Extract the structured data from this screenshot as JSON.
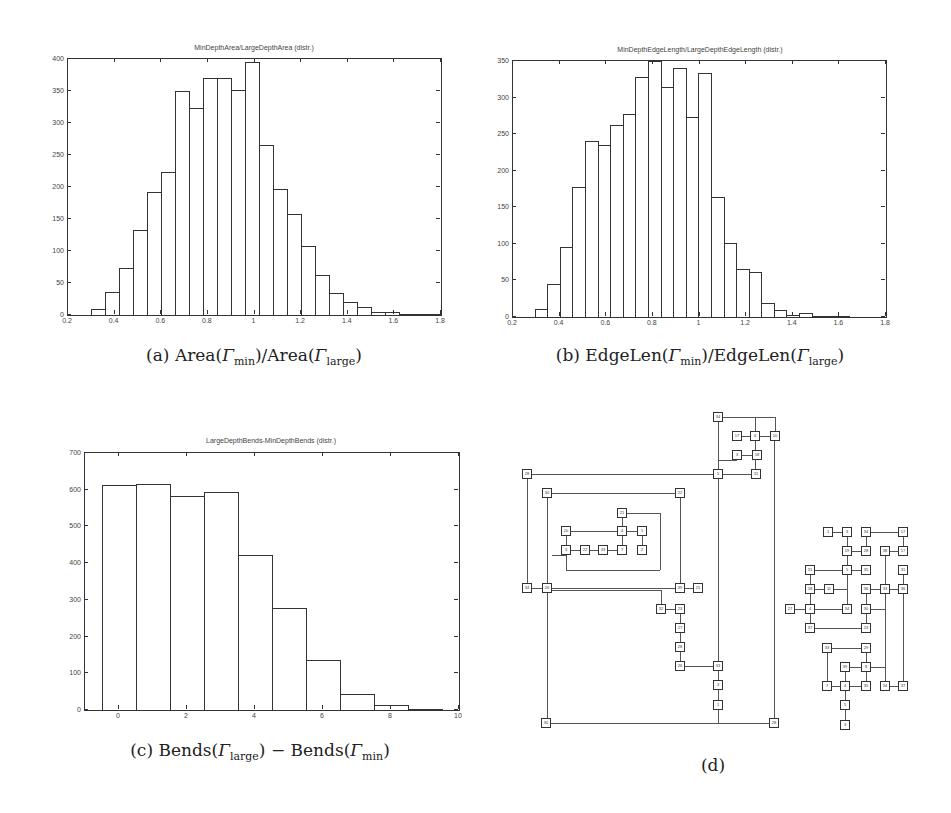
{
  "chart_data": [
    {
      "id": "a",
      "type": "bar",
      "title": "MinDepthArea/LargeDepthArea (distr.)",
      "caption": {
        "prefix": "(a) Area(",
        "g1": "Γ",
        "s1": "min",
        "mid": ")/Area(",
        "g2": "Γ",
        "s2": "large",
        "suffix": ")"
      },
      "xlabel": "",
      "ylabel": "",
      "xlim": [
        0.2,
        1.8
      ],
      "ylim": [
        0,
        400
      ],
      "xticks": [
        "0.2",
        "0.4",
        "0.6",
        "0.8",
        "1",
        "1.2",
        "1.4",
        "1.6",
        "1.8"
      ],
      "yticks": [
        "0",
        "50",
        "100",
        "150",
        "200",
        "250",
        "300",
        "350",
        "400"
      ],
      "bin_width": 0.06,
      "x": [
        0.3,
        0.36,
        0.42,
        0.48,
        0.54,
        0.6,
        0.66,
        0.72,
        0.78,
        0.84,
        0.9,
        0.96,
        1.02,
        1.08,
        1.14,
        1.2,
        1.26,
        1.32,
        1.38,
        1.44,
        1.5,
        1.56,
        1.62,
        1.68,
        1.74
      ],
      "values": [
        9,
        36,
        73,
        133,
        192,
        223,
        350,
        323,
        370,
        370,
        352,
        396,
        266,
        197,
        158,
        108,
        62,
        35,
        20,
        13,
        5,
        5,
        2,
        1,
        1
      ],
      "grid": false,
      "legend": "none"
    },
    {
      "id": "b",
      "type": "bar",
      "title": "MinDepthEdgeLength/LargeDepthEdgeLength (distr.)",
      "caption": {
        "prefix": "(b) EdgeLen(",
        "g1": "Γ",
        "s1": "min",
        "mid": ")/EdgeLen(",
        "g2": "Γ",
        "s2": "large",
        "suffix": ")"
      },
      "xlabel": "",
      "ylabel": "",
      "xlim": [
        0.2,
        1.8
      ],
      "ylim": [
        0,
        350
      ],
      "xticks": [
        "0.2",
        "0.4",
        "0.6",
        "0.8",
        "1",
        "1.2",
        "1.4",
        "1.6",
        "1.8"
      ],
      "yticks": [
        "0",
        "50",
        "100",
        "150",
        "200",
        "250",
        "300",
        "350"
      ],
      "bin_width": 0.054,
      "x": [
        0.293,
        0.347,
        0.401,
        0.455,
        0.509,
        0.563,
        0.617,
        0.671,
        0.725,
        0.779,
        0.833,
        0.887,
        0.941,
        0.995,
        1.049,
        1.103,
        1.157,
        1.211,
        1.265,
        1.319,
        1.373,
        1.427,
        1.481,
        1.535,
        1.589
      ],
      "values": [
        11,
        45,
        96,
        178,
        240,
        235,
        263,
        277,
        328,
        350,
        315,
        341,
        274,
        333,
        164,
        101,
        66,
        61,
        19,
        9,
        3,
        5,
        0,
        0,
        2
      ],
      "grid": false,
      "legend": "none"
    },
    {
      "id": "c",
      "type": "bar",
      "title": "LargeDepthBends-MinDepthBends (distr.)",
      "caption": {
        "prefix": "(c) Bends(",
        "g1": "Γ",
        "s1": "large",
        "mid": ") − Bends(",
        "g2": "Γ",
        "s2": "min",
        "suffix": ")"
      },
      "xlabel": "",
      "ylabel": "",
      "xlim": [
        -1,
        10
      ],
      "ylim": [
        0,
        700
      ],
      "xticks": [
        "0",
        "2",
        "4",
        "6",
        "8",
        "10"
      ],
      "yticks": [
        "0",
        "100",
        "200",
        "300",
        "400",
        "500",
        "600",
        "700"
      ],
      "categories": [
        "0",
        "1",
        "2",
        "3",
        "4",
        "5",
        "6",
        "7",
        "8",
        "9"
      ],
      "values": [
        612,
        615,
        582,
        595,
        422,
        278,
        137,
        43,
        13,
        3
      ],
      "grid": false,
      "legend": "none"
    }
  ],
  "diagram": {
    "caption": "(d)",
    "nodes": [
      {
        "x": 718,
        "y": 417,
        "l": "34"
      },
      {
        "x": 737,
        "y": 436,
        "l": "17"
      },
      {
        "x": 755,
        "y": 436,
        "l": "6"
      },
      {
        "x": 775,
        "y": 436,
        "l": "10"
      },
      {
        "x": 737,
        "y": 455,
        "l": "3"
      },
      {
        "x": 757,
        "y": 455,
        "l": "18"
      },
      {
        "x": 718,
        "y": 474,
        "l": "5"
      },
      {
        "x": 756,
        "y": 474,
        "l": "31"
      },
      {
        "x": 527,
        "y": 474,
        "l": "28"
      },
      {
        "x": 547,
        "y": 493,
        "l": "30"
      },
      {
        "x": 680,
        "y": 493,
        "l": "22"
      },
      {
        "x": 622,
        "y": 513,
        "l": "21"
      },
      {
        "x": 566,
        "y": 531,
        "l": "20"
      },
      {
        "x": 622,
        "y": 531,
        "l": "4"
      },
      {
        "x": 642,
        "y": 531,
        "l": "1"
      },
      {
        "x": 566,
        "y": 550,
        "l": "3"
      },
      {
        "x": 585,
        "y": 550,
        "l": "22"
      },
      {
        "x": 603,
        "y": 550,
        "l": "33"
      },
      {
        "x": 622,
        "y": 550,
        "l": "7"
      },
      {
        "x": 642,
        "y": 550,
        "l": "2"
      },
      {
        "x": 527,
        "y": 588,
        "l": "34"
      },
      {
        "x": 547,
        "y": 588,
        "l": "26"
      },
      {
        "x": 680,
        "y": 588,
        "l": "39"
      },
      {
        "x": 698,
        "y": 588,
        "l": "25"
      },
      {
        "x": 661,
        "y": 609,
        "l": "32"
      },
      {
        "x": 680,
        "y": 609,
        "l": "23"
      },
      {
        "x": 680,
        "y": 628,
        "l": "27"
      },
      {
        "x": 680,
        "y": 647,
        "l": "28"
      },
      {
        "x": 680,
        "y": 666,
        "l": "26"
      },
      {
        "x": 718,
        "y": 666,
        "l": "33"
      },
      {
        "x": 718,
        "y": 685,
        "l": "3"
      },
      {
        "x": 718,
        "y": 705,
        "l": "1"
      },
      {
        "x": 546,
        "y": 723,
        "l": "30"
      },
      {
        "x": 774,
        "y": 723,
        "l": "28"
      },
      {
        "x": 828,
        "y": 532,
        "l": "1"
      },
      {
        "x": 847,
        "y": 532,
        "l": "3"
      },
      {
        "x": 866,
        "y": 532,
        "l": "34"
      },
      {
        "x": 903,
        "y": 532,
        "l": "17"
      },
      {
        "x": 847,
        "y": 551,
        "l": "19"
      },
      {
        "x": 866,
        "y": 551,
        "l": "28"
      },
      {
        "x": 885,
        "y": 551,
        "l": "38"
      },
      {
        "x": 903,
        "y": 551,
        "l": "17"
      },
      {
        "x": 810,
        "y": 570,
        "l": "31"
      },
      {
        "x": 847,
        "y": 570,
        "l": "5"
      },
      {
        "x": 866,
        "y": 570,
        "l": "35"
      },
      {
        "x": 903,
        "y": 570,
        "l": "31"
      },
      {
        "x": 810,
        "y": 589,
        "l": "18"
      },
      {
        "x": 829,
        "y": 589,
        "l": "11"
      },
      {
        "x": 866,
        "y": 589,
        "l": "36"
      },
      {
        "x": 885,
        "y": 589,
        "l": "33"
      },
      {
        "x": 903,
        "y": 589,
        "l": "36"
      },
      {
        "x": 790,
        "y": 609,
        "l": "27"
      },
      {
        "x": 810,
        "y": 609,
        "l": "4"
      },
      {
        "x": 847,
        "y": 609,
        "l": "34"
      },
      {
        "x": 866,
        "y": 609,
        "l": "30"
      },
      {
        "x": 810,
        "y": 628,
        "l": "37"
      },
      {
        "x": 866,
        "y": 628,
        "l": "23"
      },
      {
        "x": 827,
        "y": 648,
        "l": "33"
      },
      {
        "x": 866,
        "y": 648,
        "l": "29"
      },
      {
        "x": 845,
        "y": 667,
        "l": "39"
      },
      {
        "x": 866,
        "y": 667,
        "l": "8"
      },
      {
        "x": 827,
        "y": 686,
        "l": "7"
      },
      {
        "x": 845,
        "y": 686,
        "l": "4"
      },
      {
        "x": 866,
        "y": 686,
        "l": "35"
      },
      {
        "x": 885,
        "y": 686,
        "l": "34"
      },
      {
        "x": 903,
        "y": 686,
        "l": "37"
      },
      {
        "x": 845,
        "y": 705,
        "l": "5"
      },
      {
        "x": 845,
        "y": 725,
        "l": "3"
      }
    ],
    "edges": [
      [
        718,
        417,
        775,
        417
      ],
      [
        775,
        417,
        775,
        436
      ],
      [
        718,
        417,
        718,
        723
      ],
      [
        737,
        436,
        755,
        436
      ],
      [
        755,
        436,
        775,
        436
      ],
      [
        755,
        417,
        755,
        474
      ],
      [
        737,
        455,
        757,
        455
      ],
      [
        718,
        474,
        756,
        474
      ],
      [
        718,
        460,
        737,
        460
      ],
      [
        527,
        474,
        718,
        474
      ],
      [
        527,
        474,
        527,
        588
      ],
      [
        547,
        493,
        680,
        493
      ],
      [
        547,
        493,
        547,
        723
      ],
      [
        680,
        493,
        680,
        588
      ],
      [
        622,
        513,
        660,
        513
      ],
      [
        660,
        513,
        660,
        570
      ],
      [
        566,
        531,
        622,
        531
      ],
      [
        622,
        513,
        622,
        550
      ],
      [
        622,
        531,
        642,
        531
      ],
      [
        642,
        531,
        642,
        550
      ],
      [
        566,
        531,
        566,
        570
      ],
      [
        566,
        550,
        622,
        550
      ],
      [
        566,
        570,
        660,
        570
      ],
      [
        552,
        555,
        566,
        555
      ],
      [
        527,
        588,
        698,
        588
      ],
      [
        547,
        590,
        661,
        590
      ],
      [
        661,
        590,
        661,
        609
      ],
      [
        661,
        609,
        680,
        609
      ],
      [
        680,
        609,
        680,
        666
      ],
      [
        680,
        666,
        718,
        666
      ],
      [
        718,
        666,
        718,
        705
      ],
      [
        546,
        723,
        774,
        723
      ],
      [
        774,
        436,
        774,
        723
      ],
      [
        828,
        532,
        847,
        532
      ],
      [
        847,
        532,
        847,
        609
      ],
      [
        866,
        532,
        903,
        532
      ],
      [
        866,
        532,
        866,
        551
      ],
      [
        903,
        532,
        903,
        551
      ],
      [
        847,
        551,
        866,
        551
      ],
      [
        885,
        551,
        903,
        551
      ],
      [
        885,
        551,
        885,
        686
      ],
      [
        810,
        570,
        847,
        570
      ],
      [
        847,
        570,
        866,
        570
      ],
      [
        810,
        570,
        810,
        628
      ],
      [
        903,
        570,
        903,
        686
      ],
      [
        866,
        589,
        903,
        589
      ],
      [
        810,
        589,
        829,
        589
      ],
      [
        829,
        589,
        847,
        589
      ],
      [
        790,
        609,
        847,
        609
      ],
      [
        866,
        589,
        866,
        628
      ],
      [
        866,
        609,
        885,
        609
      ],
      [
        810,
        628,
        866,
        628
      ],
      [
        827,
        648,
        866,
        648
      ],
      [
        827,
        648,
        827,
        686
      ],
      [
        866,
        648,
        866,
        686
      ],
      [
        845,
        667,
        866,
        667
      ],
      [
        827,
        686,
        845,
        686
      ],
      [
        845,
        686,
        866,
        686
      ],
      [
        845,
        667,
        845,
        725
      ],
      [
        885,
        686,
        903,
        686
      ],
      [
        866,
        667,
        885,
        667
      ]
    ]
  }
}
